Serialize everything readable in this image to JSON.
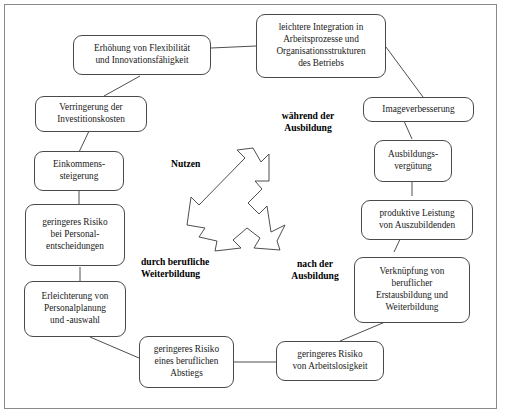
{
  "diagram": {
    "title_hidden": "",
    "frame": {
      "border_color": "#8a8a8a"
    },
    "style": {
      "node_border_color": "#4a4a4a",
      "node_fill": "#ffffff",
      "edge_color": "#3a3a3a",
      "text_color": "#1a1a1a"
    },
    "center_labels": [
      {
        "id": "nutzen",
        "text": "Nutzen"
      },
      {
        "id": "waehrend-der-ausbildung",
        "text": "während der\nAusbildung"
      },
      {
        "id": "nach-der-ausbildung",
        "text": "nach der\nAusbildung"
      },
      {
        "id": "durch-berufliche-weiterbildung",
        "text": "durch berufliche\nWeiterbildung"
      }
    ],
    "nodes": [
      {
        "id": "leichtere-integration",
        "text": "leichtere Integration in\nArbeitsprozesse und\nOrganisationsstrukturen\ndes Betriebs"
      },
      {
        "id": "erhoehung-flexibilitaet",
        "text": "Erhöhung von Flexibilität\nund Innovationsfähigkeit"
      },
      {
        "id": "verringerung-investitionskosten",
        "text": "Verringerung der\nInvestitionskosten"
      },
      {
        "id": "einkommenssteigerung",
        "text": "Einkommens-\nsteigerung"
      },
      {
        "id": "geringeres-risiko-personalentscheidungen",
        "text": "geringeres Risiko\nbei Personal-\nentscheidungen"
      },
      {
        "id": "erleichterung-personalplanung",
        "text": "Erleichterung von\nPersonalplanung\nund -auswahl"
      },
      {
        "id": "geringeres-risiko-abstieg",
        "text": "geringeres Risiko\neines beruflichen\nAbstiegs"
      },
      {
        "id": "geringeres-risiko-arbeitslosigkeit",
        "text": "geringeres Risiko\nvon Arbeitslosigkeit"
      },
      {
        "id": "verknuepfung-erstausbildung",
        "text": "Verknüpfung von\nberuflicher\nErstausbildung und\nWeiterbildung"
      },
      {
        "id": "produktive-leistung",
        "text": "produktive Leistung\nvon Auszubildenden"
      },
      {
        "id": "ausbildungsverguetung",
        "text": "Ausbildungs-\nvergütung"
      },
      {
        "id": "imageverbesserung",
        "text": "Imageverbesserung"
      }
    ],
    "edges": [
      {
        "from": "erhoehung-flexibilitaet",
        "to": "leichtere-integration"
      },
      {
        "from": "erhoehung-flexibilitaet",
        "to": "verringerung-investitionskosten"
      },
      {
        "from": "verringerung-investitionskosten",
        "to": "einkommenssteigerung"
      },
      {
        "from": "einkommenssteigerung",
        "to": "geringeres-risiko-personalentscheidungen"
      },
      {
        "from": "geringeres-risiko-personalentscheidungen",
        "to": "erleichterung-personalplanung"
      },
      {
        "from": "erleichterung-personalplanung",
        "to": "geringeres-risiko-abstieg"
      },
      {
        "from": "geringeres-risiko-abstieg",
        "to": "geringeres-risiko-arbeitslosigkeit"
      },
      {
        "from": "geringeres-risiko-arbeitslosigkeit",
        "to": "verknuepfung-erstausbildung"
      },
      {
        "from": "verknuepfung-erstausbildung",
        "to": "produktive-leistung"
      },
      {
        "from": "produktive-leistung",
        "to": "ausbildungsverguetung"
      },
      {
        "from": "ausbildungsverguetung",
        "to": "imageverbesserung"
      },
      {
        "from": "imageverbesserung",
        "to": "leichtere-integration"
      }
    ],
    "center_arrow": {
      "id": "three-way-arrow",
      "directions": [
        "up-right",
        "down-right",
        "down-left"
      ]
    }
  }
}
